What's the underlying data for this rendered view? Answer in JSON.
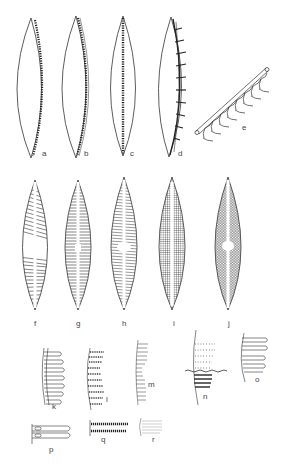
{
  "figure": {
    "panels": [
      {
        "id": "a",
        "label": "a",
        "x": 42,
        "y": 153,
        "type": "girdle-view-marginal-canal"
      },
      {
        "id": "b",
        "label": "b",
        "x": 84,
        "y": 153,
        "type": "girdle-view-double-canal"
      },
      {
        "id": "c",
        "label": "c",
        "x": 130,
        "y": 153,
        "type": "girdle-view-central-canal"
      },
      {
        "id": "d",
        "label": "d",
        "x": 178,
        "y": 153,
        "type": "girdle-view-chambered"
      },
      {
        "id": "e",
        "label": "e",
        "x": 242,
        "y": 127,
        "type": "canal-detail-oblique"
      },
      {
        "id": "f",
        "label": "f",
        "x": 35,
        "y": 323,
        "type": "valve-radiate-striae"
      },
      {
        "id": "g",
        "label": "g",
        "x": 77,
        "y": 323,
        "type": "valve-parallel-striae"
      },
      {
        "id": "h",
        "label": "h",
        "x": 123,
        "y": 323,
        "type": "valve-fine-striae"
      },
      {
        "id": "i",
        "label": "i",
        "x": 173,
        "y": 323,
        "type": "valve-reticulate"
      },
      {
        "id": "j",
        "label": "j",
        "x": 228,
        "y": 323,
        "type": "valve-areolate"
      },
      {
        "id": "k",
        "label": "k",
        "x": 52,
        "y": 405,
        "type": "stria-detail-chambered"
      },
      {
        "id": "l",
        "label": "l",
        "x": 106,
        "y": 398,
        "type": "stria-detail-loculate"
      },
      {
        "id": "m",
        "label": "m",
        "x": 148,
        "y": 383,
        "type": "stria-detail-simple"
      },
      {
        "id": "n",
        "label": "n",
        "x": 203,
        "y": 395,
        "type": "stria-detail-punctate"
      },
      {
        "id": "o",
        "label": "o",
        "x": 255,
        "y": 378,
        "type": "stria-detail-costate"
      },
      {
        "id": "p",
        "label": "p",
        "x": 49,
        "y": 448,
        "type": "stria-detail-tubular"
      },
      {
        "id": "q",
        "label": "q",
        "x": 101,
        "y": 438,
        "type": "stria-detail-beaded"
      },
      {
        "id": "r",
        "label": "r",
        "x": 152,
        "y": 438,
        "type": "stria-detail-faint"
      }
    ]
  },
  "colors": {
    "background": "#ffffff",
    "ink": "#333333",
    "label": "#444444"
  }
}
